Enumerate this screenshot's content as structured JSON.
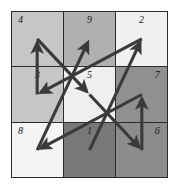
{
  "figure": {
    "kind": "magic-square-path-diagram",
    "width": 177,
    "height": 186,
    "background_color": "#ffffff",
    "border_color": "#2a2a2a",
    "arrow_color": "#3a3a3c",
    "label_color": "#17171a"
  },
  "grid": {
    "rows": 3,
    "columns": 3,
    "cells": [
      {
        "label": "4",
        "row": 0,
        "col": 0,
        "fill": "#c6c6c6",
        "label_align": "left"
      },
      {
        "label": "9",
        "row": 0,
        "col": 1,
        "fill": "#b0b0b0",
        "label_align": "center"
      },
      {
        "label": "2",
        "row": 0,
        "col": 2,
        "fill": "#f0f0f0",
        "label_align": "center"
      },
      {
        "label": "3",
        "row": 1,
        "col": 0,
        "fill": "#c6c6c6",
        "label_align": "center"
      },
      {
        "label": "5",
        "row": 1,
        "col": 1,
        "fill": "#efefef",
        "label_align": "center"
      },
      {
        "label": "7",
        "row": 1,
        "col": 2,
        "fill": "#909090",
        "label_align": "right"
      },
      {
        "label": "8",
        "row": 2,
        "col": 0,
        "fill": "#f4f4f4",
        "label_align": "left"
      },
      {
        "label": "1",
        "row": 2,
        "col": 1,
        "fill": "#787878",
        "label_align": "center"
      },
      {
        "label": "6",
        "row": 2,
        "col": 2,
        "fill": "#8c8c8c",
        "label_align": "right"
      }
    ]
  },
  "path": {
    "description": "Arrows connect cell centres in ascending numeric order 1 through 9",
    "sequence": [
      "1",
      "2",
      "3",
      "4",
      "5",
      "6",
      "7",
      "8",
      "9"
    ],
    "segments": [
      {
        "from": "1",
        "to": "2",
        "from_cell": [
          2,
          1
        ],
        "to_cell": [
          0,
          2
        ]
      },
      {
        "from": "2",
        "to": "3",
        "from_cell": [
          0,
          2
        ],
        "to_cell": [
          1,
          0
        ]
      },
      {
        "from": "3",
        "to": "4",
        "from_cell": [
          1,
          0
        ],
        "to_cell": [
          0,
          0
        ]
      },
      {
        "from": "4",
        "to": "5",
        "from_cell": [
          0,
          0
        ],
        "to_cell": [
          1,
          1
        ]
      },
      {
        "from": "5",
        "to": "6",
        "from_cell": [
          1,
          1
        ],
        "to_cell": [
          2,
          2
        ]
      },
      {
        "from": "6",
        "to": "7",
        "from_cell": [
          2,
          2
        ],
        "to_cell": [
          1,
          2
        ]
      },
      {
        "from": "7",
        "to": "8",
        "from_cell": [
          1,
          2
        ],
        "to_cell": [
          2,
          0
        ]
      },
      {
        "from": "8",
        "to": "9",
        "from_cell": [
          2,
          0
        ],
        "to_cell": [
          0,
          1
        ]
      }
    ]
  }
}
